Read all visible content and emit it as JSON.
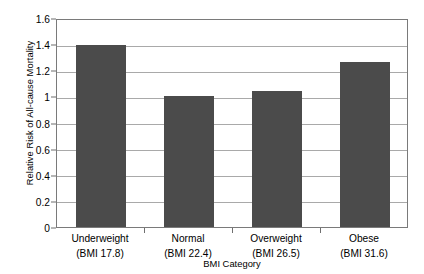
{
  "chart_data": {
    "type": "bar",
    "title": "",
    "xlabel": "BMI Category",
    "ylabel": "Relative Risk of All-cause Mortality",
    "categories": [
      "Underweight",
      "Normal",
      "Overweight",
      "Obese"
    ],
    "category_sublabels": [
      "(BMI 17.8)",
      "(BMI 22.4)",
      "(BMI 26.5)",
      "(BMI 31.6)"
    ],
    "values": [
      1.39,
      1.0,
      1.04,
      1.26
    ],
    "ylim": [
      0,
      1.6
    ],
    "ytick_labels": [
      "0",
      "0.2",
      "0.4",
      "0.6",
      "0.8",
      "1",
      "1.2",
      "1.4",
      "1.6"
    ],
    "ytick_values": [
      0,
      0.2,
      0.4,
      0.6,
      0.8,
      1.0,
      1.2,
      1.4,
      1.6
    ],
    "grid": true,
    "legend": "none",
    "bar_color": "#4b4b4b",
    "gridline_color": "#a9a9a9",
    "axis_color": "#7a7a7a",
    "background_color": "#ffffff"
  }
}
